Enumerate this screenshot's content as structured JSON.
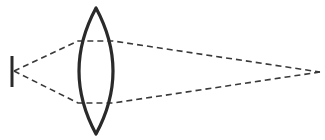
{
  "diagram": {
    "colors": {
      "stroke": "#2a2a2a",
      "ray": "#3a3a3a",
      "background": "#ffffff"
    },
    "elements": {
      "screen": {
        "x": 12,
        "y1": 56,
        "y2": 87
      },
      "lens": {
        "top": [
          96,
          8
        ],
        "bottom": [
          96,
          134
        ],
        "left_x": 74,
        "right_x": 119
      },
      "source_point": [
        320,
        72
      ],
      "image_point": [
        14,
        71
      ],
      "rays": [
        {
          "from": [
            14,
            71
          ],
          "via_left": [
            78,
            41
          ],
          "via_right": [
            113,
            41
          ],
          "to": [
            320,
            72
          ]
        },
        {
          "from": [
            14,
            71
          ],
          "via_left": [
            78,
            103
          ],
          "via_right": [
            113,
            103
          ],
          "to": [
            320,
            72
          ]
        }
      ]
    }
  }
}
